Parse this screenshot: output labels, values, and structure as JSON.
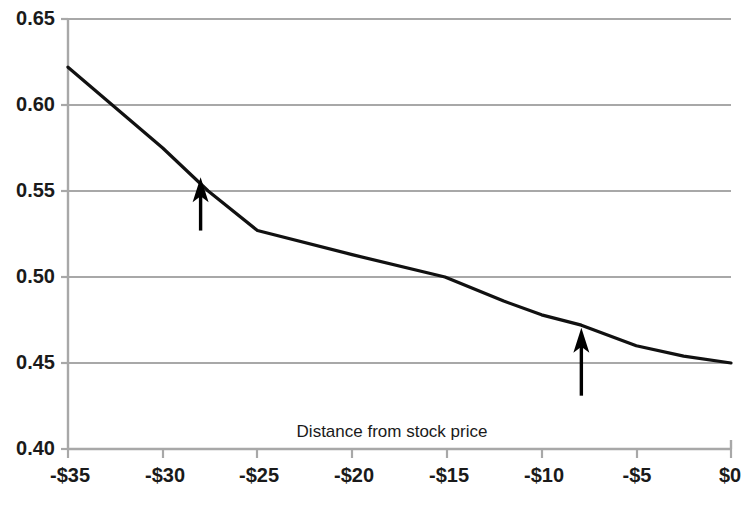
{
  "chart_data": {
    "type": "line",
    "title": "",
    "subtitle": "",
    "xlabel": "Distance from stock price",
    "ylabel": "",
    "xlim": [
      -35,
      0
    ],
    "ylim": [
      0.4,
      0.65
    ],
    "grid": true,
    "grid_axis": "y",
    "legend": false,
    "legend_position": "none",
    "x_tick_labels": [
      "-$35",
      "-$30",
      "-$25",
      "-$20",
      "-$15",
      "-$10",
      "-$5",
      "$0"
    ],
    "x_tick_values": [
      -35,
      -30,
      -25,
      -20,
      -15,
      -10,
      -5,
      0
    ],
    "y_tick_labels": [
      "0.65",
      "0.60",
      "0.55",
      "0.50",
      "0.45",
      "0.40"
    ],
    "y_tick_values": [
      0.65,
      0.6,
      0.55,
      0.5,
      0.45,
      0.4
    ],
    "series": [
      {
        "name": "curve",
        "color": "#111111",
        "x": [
          -35,
          -30,
          -27.6,
          -25,
          -20,
          -15.1,
          -12,
          -10,
          -7.9,
          -5,
          -2.5,
          0
        ],
        "values": [
          0.622,
          0.575,
          0.55,
          0.527,
          0.513,
          0.5,
          0.486,
          0.478,
          0.472,
          0.46,
          0.454,
          0.45
        ]
      }
    ],
    "annotations": [
      {
        "name": "left-arrow",
        "shape": "arrow-up",
        "x": -28,
        "y_tip": 0.558,
        "y_tail": 0.527,
        "color": "#000000"
      },
      {
        "name": "right-arrow",
        "shape": "arrow-up",
        "x": -7.9,
        "y_tip": 0.4705,
        "y_tail": 0.431,
        "color": "#000000"
      }
    ]
  },
  "colors": {
    "background": "#ffffff",
    "grid": "#a8a8a8",
    "axis": "#a8a8a8",
    "line": "#111111",
    "text": "#1a1a1a",
    "annotation": "#000000"
  },
  "labels": {
    "x_axis_title": "Distance from stock price",
    "y_0": "0.65",
    "y_1": "0.60",
    "y_2": "0.55",
    "y_3": "0.50",
    "y_4": "0.45",
    "y_5": "0.40",
    "x_0": "-$35",
    "x_1": "-$30",
    "x_2": "-$25",
    "x_3": "-$20",
    "x_4": "-$15",
    "x_5": "-$10",
    "x_6": "-$5",
    "x_7": "$0"
  }
}
